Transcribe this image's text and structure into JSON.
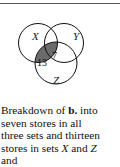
{
  "diagram": {
    "type": "venn",
    "sets": [
      {
        "label": "X"
      },
      {
        "label": "Y"
      },
      {
        "label": "Z"
      }
    ],
    "regions": [
      {
        "sets": [
          "X",
          "Y",
          "Z"
        ],
        "value": "7",
        "shaded": true
      },
      {
        "sets": [
          "X",
          "Z"
        ],
        "value": "13",
        "shaded": true
      }
    ],
    "shade_color": "#6b6b6b"
  },
  "caption": {
    "line1_pre": "Breakdown of ",
    "line1_bold": "b.",
    "line1_post": " into",
    "line2": "seven stores in all",
    "line3": "three sets and thirteen",
    "line4_pre": "stores in sets ",
    "line4_x": "X",
    "line4_mid": " and ",
    "line4_z": "Z",
    "line5": "and"
  }
}
